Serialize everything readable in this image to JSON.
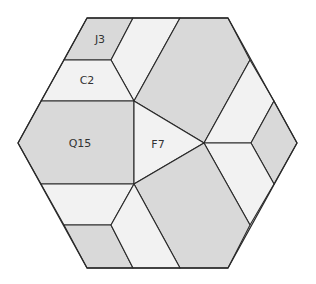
{
  "diagram": {
    "type": "hexagon-dissection",
    "colors": {
      "gray": "#d9d9d9",
      "light": "#f2f2f2",
      "stroke": "#2a2a2a",
      "background": "#ffffff"
    },
    "hexagon": [
      [
        87,
        18
      ],
      [
        228,
        18
      ],
      [
        297,
        143
      ],
      [
        228,
        268
      ],
      [
        87,
        268
      ],
      [
        18,
        143
      ]
    ],
    "pieces": [
      {
        "id": "J3",
        "label": "J3",
        "fill": "gray",
        "points": [
          [
            87,
            18
          ],
          [
            133,
            18
          ],
          [
            111,
            60
          ],
          [
            64,
            60
          ]
        ],
        "label_pos": [
          100,
          40
        ]
      },
      {
        "id": "top-middle",
        "label": "",
        "fill": "light",
        "points": [
          [
            133,
            18
          ],
          [
            180,
            18
          ],
          [
            134,
            101
          ],
          [
            111,
            60
          ]
        ]
      },
      {
        "id": "C2",
        "label": "C2",
        "fill": "light",
        "points": [
          [
            64,
            60
          ],
          [
            111,
            60
          ],
          [
            134,
            101
          ],
          [
            41,
            101
          ]
        ],
        "label_pos": [
          87,
          81
        ]
      },
      {
        "id": "top-right",
        "label": "",
        "fill": "gray",
        "points": [
          [
            180,
            18
          ],
          [
            228,
            18
          ],
          [
            250,
            60
          ],
          [
            204,
            143
          ],
          [
            134,
            101
          ]
        ]
      },
      {
        "id": "right-upper",
        "label": "",
        "fill": "light",
        "points": [
          [
            250,
            60
          ],
          [
            274,
            101
          ],
          [
            251,
            143
          ],
          [
            204,
            143
          ]
        ]
      },
      {
        "id": "right-diamond",
        "label": "",
        "fill": "gray",
        "points": [
          [
            274,
            101
          ],
          [
            297,
            143
          ],
          [
            274,
            184
          ],
          [
            251,
            143
          ]
        ]
      },
      {
        "id": "right-lower",
        "label": "",
        "fill": "light",
        "points": [
          [
            204,
            143
          ],
          [
            251,
            143
          ],
          [
            274,
            184
          ],
          [
            250,
            225
          ]
        ]
      },
      {
        "id": "Q15",
        "label": "Q15",
        "fill": "gray",
        "points": [
          [
            41,
            101
          ],
          [
            134,
            101
          ],
          [
            134,
            184
          ],
          [
            41,
            184
          ],
          [
            18,
            143
          ]
        ],
        "label_pos": [
          80,
          144
        ]
      },
      {
        "id": "F7",
        "label": "F7",
        "fill": "light",
        "points": [
          [
            134,
            101
          ],
          [
            204,
            143
          ],
          [
            134,
            184
          ]
        ],
        "label_pos": [
          158,
          145
        ]
      },
      {
        "id": "bottom-right",
        "label": "",
        "fill": "gray",
        "points": [
          [
            134,
            184
          ],
          [
            204,
            143
          ],
          [
            250,
            225
          ],
          [
            228,
            268
          ],
          [
            180,
            268
          ]
        ]
      },
      {
        "id": "bottom-left-light",
        "label": "",
        "fill": "light",
        "points": [
          [
            41,
            184
          ],
          [
            134,
            184
          ],
          [
            111,
            225
          ],
          [
            64,
            225
          ]
        ]
      },
      {
        "id": "bottom-left-gray",
        "label": "",
        "fill": "gray",
        "points": [
          [
            64,
            225
          ],
          [
            111,
            225
          ],
          [
            133,
            268
          ],
          [
            87,
            268
          ]
        ]
      },
      {
        "id": "bottom-middle",
        "label": "",
        "fill": "light",
        "points": [
          [
            111,
            225
          ],
          [
            134,
            184
          ],
          [
            180,
            268
          ],
          [
            133,
            268
          ]
        ]
      }
    ]
  }
}
